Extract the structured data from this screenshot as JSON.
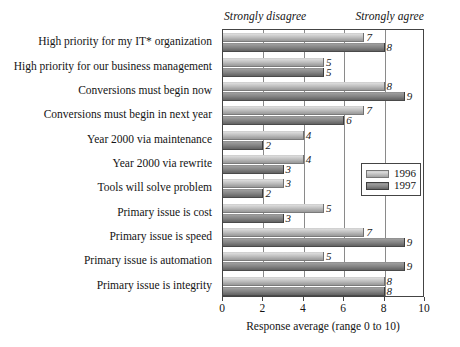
{
  "chart_data": {
    "type": "bar",
    "orientation": "horizontal",
    "title": "",
    "xlabel": "Response average (range 0 to 10)",
    "ylabel": "",
    "xlim": [
      0,
      10
    ],
    "xticks": [
      0,
      2,
      4,
      6,
      8,
      10
    ],
    "grid": true,
    "legend_position": "middle-right inside plot",
    "annotations": {
      "left": "Strongly disagree",
      "right": "Strongly agree"
    },
    "footnote_marker": "IT*",
    "categories": [
      "High priority for my IT* organization",
      "High priority for our business management",
      "Conversions must begin now",
      "Conversions must begin in next year",
      "Year 2000 via maintenance",
      "Year 2000 via rewrite",
      "Tools will solve problem",
      "Primary issue is cost",
      "Primary issue is speed",
      "Primary issue is automation",
      "Primary issue is integrity"
    ],
    "series": [
      {
        "name": "1996",
        "color": "#c4c4c4",
        "values": [
          7,
          5,
          8,
          7,
          4,
          4,
          3,
          5,
          7,
          5,
          8
        ]
      },
      {
        "name": "1997",
        "color": "#838383",
        "values": [
          8,
          5,
          9,
          6,
          2,
          3,
          2,
          3,
          9,
          9,
          8
        ]
      }
    ]
  },
  "legend": {
    "entries": [
      {
        "label": "1996"
      },
      {
        "label": "1997"
      }
    ]
  },
  "axis": {
    "tick_labels": [
      "0",
      "2",
      "4",
      "6",
      "8",
      "10"
    ],
    "xlabel": "Response average (range 0 to 10)"
  },
  "header": {
    "left_anchor": "Strongly disagree",
    "right_anchor": "Strongly agree"
  }
}
